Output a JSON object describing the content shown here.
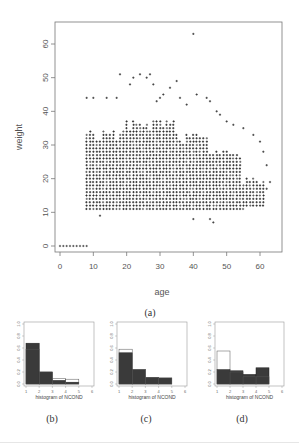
{
  "figure": {
    "captions": {
      "a": "(a)",
      "b": "(b)",
      "c": "(c)",
      "d": "(d)"
    }
  },
  "chart_data": [
    {
      "id": "a",
      "type": "scatter",
      "title": "",
      "xlabel": "age",
      "ylabel": "weight",
      "xlim": [
        0,
        64
      ],
      "ylim": [
        0,
        64
      ],
      "x_ticks": [
        0,
        10,
        20,
        30,
        40,
        50,
        60
      ],
      "y_ticks": [
        0,
        10,
        20,
        30,
        40,
        50,
        60
      ],
      "grid": false,
      "marker": "+",
      "description": "Dense grid of points for age 8-62, weight ~11-38, tapering at older ages; outliers up to weight ~63 near age 40; a row of points at weight 0 for ages 0-8",
      "dense_region": [
        {
          "age_from": 8,
          "age_to": 20,
          "w_min": 11,
          "w_max": 35
        },
        {
          "age_from": 20,
          "age_to": 35,
          "w_min": 11,
          "w_max": 38
        },
        {
          "age_from": 35,
          "age_to": 45,
          "w_min": 11,
          "w_max": 34
        },
        {
          "age_from": 45,
          "age_to": 55,
          "w_min": 11,
          "w_max": 30
        },
        {
          "age_from": 55,
          "age_to": 62,
          "w_min": 12,
          "w_max": 22
        }
      ],
      "outliers": [
        [
          8,
          44
        ],
        [
          10,
          44
        ],
        [
          14,
          44
        ],
        [
          17,
          44
        ],
        [
          18,
          51
        ],
        [
          21,
          48
        ],
        [
          22,
          50
        ],
        [
          24,
          51
        ],
        [
          26,
          50
        ],
        [
          27,
          51
        ],
        [
          28,
          48
        ],
        [
          29,
          43
        ],
        [
          30,
          44
        ],
        [
          31,
          45
        ],
        [
          33,
          47
        ],
        [
          35,
          49
        ],
        [
          36,
          44
        ],
        [
          38,
          42
        ],
        [
          40,
          63
        ],
        [
          41,
          45
        ],
        [
          44,
          44
        ],
        [
          45,
          43
        ],
        [
          47,
          40
        ],
        [
          48,
          39
        ],
        [
          50,
          37
        ],
        [
          52,
          36
        ],
        [
          55,
          35
        ],
        [
          58,
          33
        ],
        [
          60,
          31
        ],
        [
          61,
          28
        ],
        [
          62,
          24
        ],
        [
          63,
          19
        ],
        [
          62,
          17
        ],
        [
          12,
          9
        ],
        [
          45,
          8
        ],
        [
          46,
          7
        ],
        [
          40,
          8
        ]
      ],
      "zero_row": {
        "weight": 0,
        "ages": [
          0,
          1,
          2,
          3,
          4,
          5,
          6,
          7,
          8
        ]
      }
    },
    {
      "id": "b",
      "type": "bar",
      "title": "",
      "xlabel": "histogram of NCOND",
      "ylabel": "",
      "x_ticks": [
        1,
        2,
        3,
        4,
        5,
        6
      ],
      "y_ticks": [
        "0.0",
        "0.2",
        "0.4",
        "0.6",
        "0.8",
        "1.0"
      ],
      "ylim": [
        0,
        1.0
      ],
      "categories": [
        "1-2",
        "2-3",
        "3-4",
        "4-5"
      ],
      "series": [
        {
          "name": "filled",
          "values": [
            0.68,
            0.2,
            0.06,
            0.03
          ]
        },
        {
          "name": "outline",
          "values": [
            0.58,
            0.2,
            0.09,
            0.08
          ]
        }
      ]
    },
    {
      "id": "c",
      "type": "bar",
      "title": "",
      "xlabel": "histogram of NCOND",
      "ylabel": "",
      "x_ticks": [
        1,
        2,
        3,
        4,
        5,
        6
      ],
      "y_ticks": [
        "0.0",
        "0.2",
        "0.4",
        "0.6",
        "0.8",
        "1.0"
      ],
      "ylim": [
        0,
        1.0
      ],
      "categories": [
        "1-2",
        "2-3",
        "3-4",
        "4-5"
      ],
      "series": [
        {
          "name": "filled",
          "values": [
            0.52,
            0.24,
            0.11,
            0.1
          ]
        },
        {
          "name": "outline",
          "values": [
            0.58,
            0.24,
            0.11,
            0.1
          ]
        }
      ]
    },
    {
      "id": "d",
      "type": "bar",
      "title": "",
      "xlabel": "histogram of NCOND",
      "ylabel": "",
      "x_ticks": [
        1,
        2,
        3,
        4,
        5,
        6
      ],
      "y_ticks": [
        "0.0",
        "0.2",
        "0.4",
        "0.6",
        "0.8",
        "1.0"
      ],
      "ylim": [
        0,
        1.0
      ],
      "categories": [
        "1-2",
        "2-3",
        "3-4",
        "4-5"
      ],
      "series": [
        {
          "name": "filled",
          "values": [
            0.24,
            0.22,
            0.16,
            0.27
          ]
        },
        {
          "name": "outline",
          "values": [
            0.55,
            0.2,
            0.12,
            0.12
          ]
        }
      ]
    }
  ]
}
